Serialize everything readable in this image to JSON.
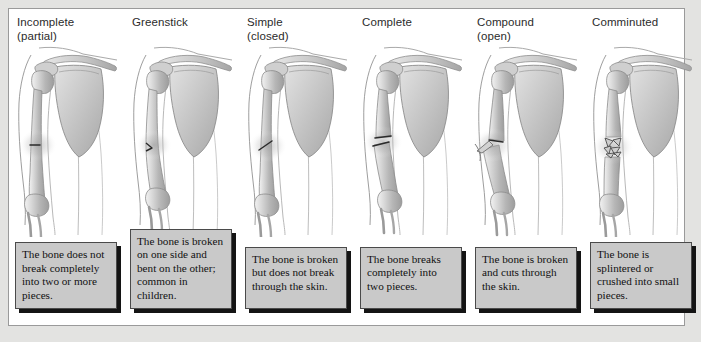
{
  "figure": {
    "background_color": "#e3e3e1",
    "panel_color": "#ffffff",
    "caption_box_color": "#c9c9c9",
    "caption_shadow_color": "#141414",
    "bone_color": "#bdbdbd",
    "outline_color": "#8d8d8d"
  },
  "columns": [
    {
      "title": "Incomplete\n(partial)",
      "caption": "The bone does not break completely into two or more pieces.",
      "fracture_type": "incomplete-partial"
    },
    {
      "title": "Greenstick",
      "caption": "The bone is broken on one side and bent on the other; common in children.",
      "fracture_type": "greenstick"
    },
    {
      "title": "Simple\n(closed)",
      "caption": "The bone is broken but does not break through the skin.",
      "fracture_type": "simple-closed"
    },
    {
      "title": "Complete",
      "caption": "The bone breaks completely into two pieces.",
      "fracture_type": "complete"
    },
    {
      "title": "Compound\n(open)",
      "caption": "The bone is broken and cuts through the skin.",
      "fracture_type": "compound-open"
    },
    {
      "title": "Comminuted",
      "caption": "The bone is splintered or crushed into small pieces.",
      "fracture_type": "comminuted"
    }
  ]
}
